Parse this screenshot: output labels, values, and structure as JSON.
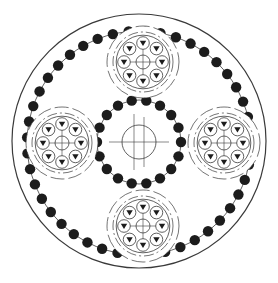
{
  "diagram": {
    "type": "planetary-gear-schematic",
    "colors": {
      "line": "#3a3a3a",
      "ball": "#1c1c1c",
      "background": "#ffffff"
    },
    "housing": {
      "cx": 139,
      "cy": 141,
      "r": 127
    },
    "ring_gear": {
      "cx": 139,
      "cy": 143,
      "r": 112,
      "ball_count": 44,
      "ball_r": 5.2
    },
    "sun_gear": {
      "cx": 139,
      "cy": 142,
      "r": 42,
      "ball_count": 18,
      "ball_r": 5.2,
      "bore_r": 17
    },
    "planets": [
      {
        "name": "top",
        "cx": 143,
        "cy": 62
      },
      {
        "name": "right",
        "cx": 224,
        "cy": 143
      },
      {
        "name": "bottom",
        "cx": 143,
        "cy": 226
      },
      {
        "name": "left",
        "cx": 62,
        "cy": 143
      }
    ],
    "planet_spec": {
      "roller_ring_r": 19,
      "roller_r": 6.3,
      "hub_r": 7,
      "dashed_r": [
        30,
        36
      ],
      "roller_count": 8
    }
  }
}
